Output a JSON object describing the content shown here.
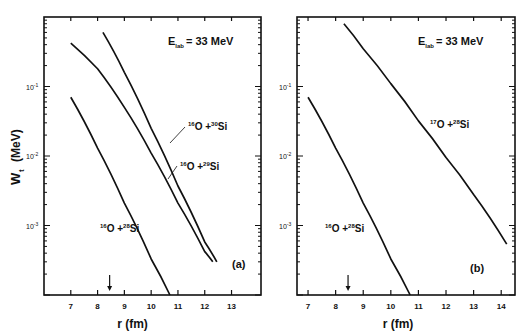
{
  "figure": {
    "ylabel": "W",
    "ylabel_sub": "t",
    "ylabel_unit": "(MeV)"
  },
  "chart_data": [
    {
      "type": "line",
      "panel": "(a)",
      "annotation": "E_lab = 33 MeV",
      "annotation_main": "E",
      "annotation_sub": "lab",
      "annotation_value": "= 33 MeV",
      "xlabel": "r (fm)",
      "ylabel": "W_t (MeV)",
      "yscale": "log",
      "xlim": [
        6.0,
        14.1
      ],
      "ylim": [
        0.0001,
        1.0
      ],
      "xticks": [
        7,
        8,
        9,
        10,
        11,
        12,
        13
      ],
      "yticks": [
        "10^-1",
        "10^-2",
        "10^-3"
      ],
      "arrow_at_x": 8.45,
      "grid": false,
      "series": [
        {
          "name": "16O + 30Si",
          "label_mass_a": "16",
          "label_a": "O +",
          "label_mass_b": "30",
          "label_b": "Si",
          "x": [
            8.2,
            9.0,
            10.0,
            11.0,
            12.0,
            12.45
          ],
          "y": [
            0.6,
            0.16,
            0.025,
            0.0037,
            0.00058,
            0.0003
          ]
        },
        {
          "name": "16O + 29Si",
          "label_mass_a": "16",
          "label_a": "O +",
          "label_mass_b": "29",
          "label_b": "Si",
          "x": [
            7.0,
            8.0,
            9.0,
            10.0,
            11.0,
            12.0,
            12.3
          ],
          "y": [
            0.42,
            0.18,
            0.05,
            0.011,
            0.0021,
            0.00042,
            0.0003
          ]
        },
        {
          "name": "16O + 28Si",
          "label_mass_a": "16",
          "label_a": "O +",
          "label_mass_b": "28",
          "label_b": "Si",
          "x": [
            7.0,
            8.0,
            9.0,
            10.0,
            10.7
          ],
          "y": [
            0.07,
            0.013,
            0.0021,
            0.00033,
            0.0001
          ]
        }
      ]
    },
    {
      "type": "line",
      "panel": "(b)",
      "annotation": "E_lab = 33 MeV",
      "annotation_main": "E",
      "annotation_sub": "lab",
      "annotation_value": "= 33 MeV",
      "xlabel": "r (fm)",
      "ylabel": "W_t (MeV)",
      "yscale": "log",
      "xlim": [
        6.6,
        14.5
      ],
      "ylim": [
        0.0001,
        1.0
      ],
      "xticks": [
        7,
        8,
        9,
        10,
        11,
        12,
        13,
        14
      ],
      "yticks": [
        "10^-1",
        "10^-2",
        "10^-3"
      ],
      "arrow_at_x": 8.45,
      "grid": false,
      "series": [
        {
          "name": "17O + 28Si",
          "label_mass_a": "17",
          "label_a": "O +",
          "label_mass_b": "28",
          "label_b": "Si",
          "x": [
            8.3,
            9.0,
            10.0,
            11.0,
            12.0,
            13.0,
            14.2
          ],
          "y": [
            0.8,
            0.35,
            0.11,
            0.032,
            0.0095,
            0.0028,
            0.00054
          ]
        },
        {
          "name": "16O + 28Si",
          "label_mass_a": "16",
          "label_a": "O +",
          "label_mass_b": "28",
          "label_b": "Si",
          "x": [
            7.0,
            8.0,
            9.0,
            10.0,
            10.7
          ],
          "y": [
            0.07,
            0.013,
            0.0021,
            0.00033,
            0.0001
          ]
        }
      ]
    }
  ]
}
